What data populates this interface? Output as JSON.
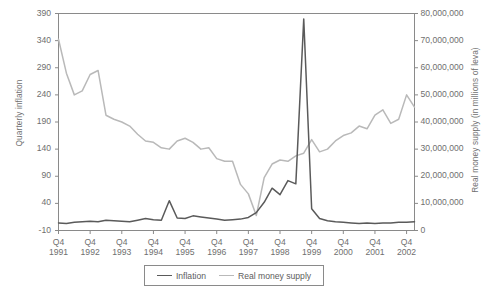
{
  "chart_data": {
    "type": "line",
    "title": "",
    "xlabel": "",
    "ylabel": "Quarterly inflation",
    "y2label": "Real money supply (in millions of leva)",
    "grid": false,
    "legend_position": "bottom-center",
    "ylim": [
      -10,
      390
    ],
    "y2lim": [
      0,
      80000000
    ],
    "yticks": [
      -10,
      40,
      90,
      140,
      190,
      240,
      290,
      340,
      390
    ],
    "ytick_labels": [
      "-10",
      "40",
      "90",
      "140",
      "190",
      "240",
      "290",
      "340",
      "390"
    ],
    "y2ticks": [
      0,
      10000000,
      20000000,
      30000000,
      40000000,
      50000000,
      60000000,
      70000000,
      80000000
    ],
    "y2tick_labels": [
      "0",
      "10,000,000",
      "20,000,000",
      "30,000,000",
      "40,000,000",
      "50,000,000",
      "60,000,000",
      "70,000,000",
      "80,000,000"
    ],
    "xtick_labels": [
      {
        "quarter": "Q4",
        "year": "1991"
      },
      {
        "quarter": "Q4",
        "year": "1992"
      },
      {
        "quarter": "Q4",
        "year": "1993"
      },
      {
        "quarter": "Q4",
        "year": "1994"
      },
      {
        "quarter": "Q4",
        "year": "1995"
      },
      {
        "quarter": "Q4",
        "year": "1996"
      },
      {
        "quarter": "Q4",
        "year": "1997"
      },
      {
        "quarter": "Q4",
        "year": "1998"
      },
      {
        "quarter": "Q4",
        "year": "1999"
      },
      {
        "quarter": "Q4",
        "year": "2000"
      },
      {
        "quarter": "Q4",
        "year": "2001"
      },
      {
        "quarter": "Q4",
        "year": "2002"
      }
    ],
    "x_index_range": [
      0,
      45
    ],
    "series": [
      {
        "name": "Inflation",
        "axis": "left",
        "color": "#5a5a5a",
        "values": [
          4,
          3,
          5,
          6,
          7,
          6,
          9,
          8,
          7,
          6,
          9,
          12,
          10,
          9,
          45,
          13,
          12,
          17,
          15,
          13,
          11,
          9,
          10,
          11,
          14,
          23,
          42,
          68,
          56,
          82,
          76,
          380,
          30,
          12,
          8,
          6,
          5,
          4,
          3,
          4,
          3,
          4,
          4,
          5,
          5,
          6
        ]
      },
      {
        "name": "Real money supply",
        "axis": "right",
        "color": "#b9b9b9",
        "values": [
          70500000,
          58000000,
          50000000,
          51500000,
          57500000,
          59000000,
          42500000,
          41000000,
          40000000,
          38500000,
          35500000,
          33000000,
          32500000,
          30500000,
          30000000,
          33000000,
          34000000,
          32500000,
          30000000,
          30500000,
          26500000,
          25500000,
          25500000,
          17000000,
          13500000,
          5500000,
          19500000,
          24500000,
          26000000,
          25500000,
          27500000,
          28500000,
          33500000,
          29000000,
          30000000,
          33000000,
          35000000,
          36000000,
          38500000,
          37500000,
          42500000,
          44500000,
          39500000,
          41000000,
          50000000,
          45500000
        ]
      }
    ]
  },
  "legend": {
    "items": [
      {
        "label": "Inflation",
        "color": "#5a5a5a"
      },
      {
        "label": "Real money supply",
        "color": "#b9b9b9"
      }
    ]
  },
  "colors": {
    "inflation_line": "#5a5a5a",
    "money_supply_line": "#b9b9b9",
    "axis": "#8a8a8a",
    "text": "#6f6f6f",
    "background": "#ffffff"
  }
}
